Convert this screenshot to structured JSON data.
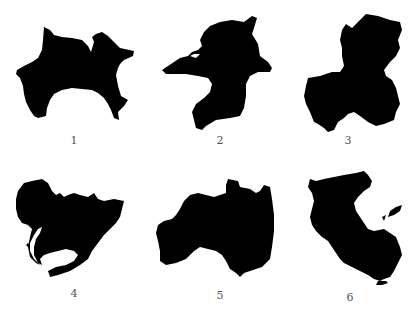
{
  "figures": [
    {
      "label": "1",
      "shape": "prefecture-silhouette-1"
    },
    {
      "label": "2",
      "shape": "prefecture-silhouette-2"
    },
    {
      "label": "3",
      "shape": "prefecture-silhouette-3"
    },
    {
      "label": "4",
      "shape": "prefecture-silhouette-4"
    },
    {
      "label": "5",
      "shape": "prefecture-silhouette-5"
    },
    {
      "label": "6",
      "shape": "prefecture-silhouette-6"
    }
  ],
  "colors": {
    "fill": "#000000",
    "background": "#ffffff",
    "label": "#555555"
  }
}
